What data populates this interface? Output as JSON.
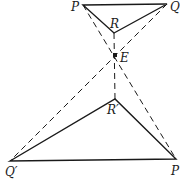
{
  "diagram": {
    "type": "geometric-figure",
    "stroke_color": "#1a1a1a",
    "points": {
      "P": {
        "label": "P",
        "x": 83,
        "y": 5
      },
      "Q": {
        "label": "Q",
        "x": 167,
        "y": 4
      },
      "R": {
        "label": "R",
        "x": 114,
        "y": 33
      },
      "E": {
        "label": "E",
        "x": 115,
        "y": 55
      },
      "R_prime": {
        "label": "R′",
        "x": 115,
        "y": 99
      },
      "Q_prime": {
        "label": "Q′",
        "x": 10,
        "y": 161
      },
      "P_prime": {
        "label": "P",
        "x": 176,
        "y": 159
      }
    },
    "solid_segments": [
      "PQ",
      "QR",
      "RP",
      "P'Q'",
      "Q'R'",
      "R'P'"
    ],
    "dashed_segments": [
      "P-E-P'",
      "Q-E-Q'",
      "R-E-R'"
    ]
  }
}
